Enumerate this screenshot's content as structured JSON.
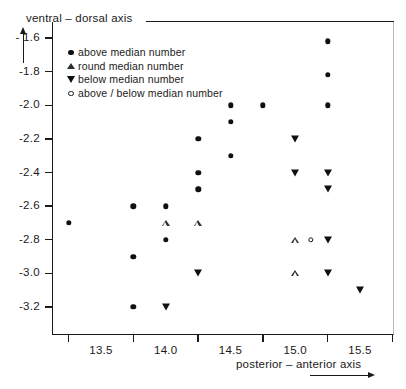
{
  "axes": {
    "y_title": "ventral –  dorsal axis",
    "x_title": "posterior –  anterior axis",
    "y_ticks": [
      "- 1.6",
      "-1.8",
      "-2.0",
      "-2.2",
      "-2.4",
      "-2.6",
      "-2.8",
      "-3.0",
      "-3.2"
    ],
    "x_ticks": [
      "13.5",
      "14.0",
      "14.5",
      "15.0",
      "15.5"
    ]
  },
  "legend": {
    "items": [
      {
        "symbol": "filled-circle",
        "label": "above  median number"
      },
      {
        "symbol": "open-triangle",
        "label": "round  median number"
      },
      {
        "symbol": "down-triangle",
        "label": "below   median number"
      },
      {
        "symbol": "open-circle",
        "label": "above / below median number"
      }
    ]
  },
  "chart_data": {
    "type": "scatter",
    "title": "",
    "xlabel": "posterior – anterior axis",
    "ylabel": "ventral – dorsal axis",
    "xlim": [
      13.12,
      15.63
    ],
    "ylim": [
      -3.28,
      -1.52
    ],
    "grid": false,
    "legend_position": "upper-left-inside",
    "series": [
      {
        "name": "above  median number",
        "marker": "filled-circle",
        "points": [
          [
            15.25,
            -1.62
          ],
          [
            15.25,
            -1.82
          ],
          [
            14.5,
            -2.0
          ],
          [
            14.75,
            -2.0
          ],
          [
            15.25,
            -2.0
          ],
          [
            14.5,
            -2.1
          ],
          [
            14.25,
            -2.2
          ],
          [
            14.5,
            -2.3
          ],
          [
            14.25,
            -2.4
          ],
          [
            14.25,
            -2.5
          ],
          [
            13.75,
            -2.6
          ],
          [
            14.0,
            -2.6
          ],
          [
            13.25,
            -2.7
          ],
          [
            14.0,
            -2.8
          ],
          [
            13.75,
            -2.9
          ],
          [
            13.75,
            -3.2
          ]
        ]
      },
      {
        "name": "round  median number",
        "marker": "open-triangle",
        "points": [
          [
            14.0,
            -2.7
          ],
          [
            14.25,
            -2.7
          ],
          [
            15.0,
            -2.8
          ],
          [
            15.0,
            -3.0
          ]
        ]
      },
      {
        "name": "below   median number",
        "marker": "down-triangle",
        "points": [
          [
            15.0,
            -2.2
          ],
          [
            15.0,
            -2.4
          ],
          [
            15.25,
            -2.4
          ],
          [
            15.25,
            -2.5
          ],
          [
            14.25,
            -3.0
          ],
          [
            15.25,
            -2.8
          ],
          [
            15.25,
            -3.0
          ],
          [
            15.5,
            -3.1
          ],
          [
            14.0,
            -3.2
          ]
        ]
      },
      {
        "name": "above / below median number",
        "marker": "open-circle",
        "points": [
          [
            15.12,
            -2.8
          ]
        ]
      }
    ]
  }
}
